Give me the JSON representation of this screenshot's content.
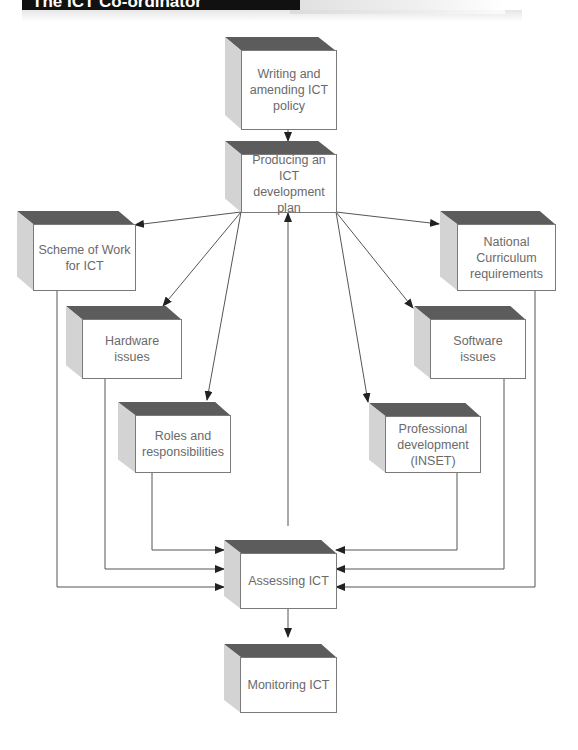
{
  "header": {
    "banner_title": "The ICT Co-ordinator"
  },
  "colors": {
    "box_top": "#5c5c5c",
    "box_side": "#d3d3d3",
    "box_front": "#ffffff",
    "box_border": "#7a7a7a",
    "text": "#6a6a6a",
    "line": "#555555"
  },
  "nodes": {
    "writing_policy": "Writing and amending ICT policy",
    "development_plan": "Producing an ICT development plan",
    "scheme_of_work": "Scheme of Work for ICT",
    "national_curriculum": "National Curriculum requirements",
    "hardware": "Hardware issues",
    "software": "Software issues",
    "roles": "Roles and responsibilities",
    "professional_dev": "Professional development (INSET)",
    "assessing": "Assessing ICT",
    "monitoring": "Monitoring ICT"
  },
  "edges": [
    {
      "from": "writing_policy",
      "to": "development_plan"
    },
    {
      "from": "development_plan",
      "to": "scheme_of_work"
    },
    {
      "from": "development_plan",
      "to": "hardware"
    },
    {
      "from": "development_plan",
      "to": "roles"
    },
    {
      "from": "development_plan",
      "to": "national_curriculum"
    },
    {
      "from": "development_plan",
      "to": "software"
    },
    {
      "from": "development_plan",
      "to": "professional_dev"
    },
    {
      "from": "scheme_of_work",
      "to": "assessing"
    },
    {
      "from": "hardware",
      "to": "assessing"
    },
    {
      "from": "roles",
      "to": "assessing"
    },
    {
      "from": "national_curriculum",
      "to": "assessing"
    },
    {
      "from": "software",
      "to": "assessing"
    },
    {
      "from": "professional_dev",
      "to": "assessing"
    },
    {
      "from": "assessing",
      "to": "development_plan"
    },
    {
      "from": "assessing",
      "to": "monitoring"
    }
  ]
}
